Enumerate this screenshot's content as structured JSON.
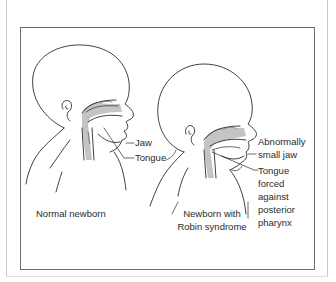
{
  "figure": {
    "left_panel": {
      "caption": "Normal newborn",
      "labels": {
        "jaw": "Jaw",
        "tongue": "Tongue"
      }
    },
    "right_panel": {
      "caption_line1": "Newborn with",
      "caption_line2": "Robin syndrome",
      "labels": {
        "jaw_line1": "Abnormally",
        "jaw_line2": "small jaw",
        "tongue_line1": "Tongue",
        "tongue_line2": "forced",
        "tongue_line3": "against",
        "tongue_line4": "posterior",
        "tongue_line5": "pharynx"
      }
    },
    "colors": {
      "line": "#2b2b2b",
      "airway_shade": "#bdbdbd",
      "frame": "#6e6e6e",
      "background": "#ffffff"
    }
  }
}
